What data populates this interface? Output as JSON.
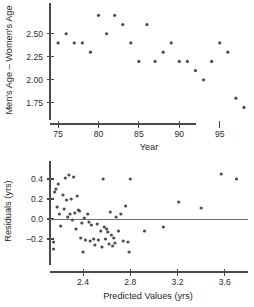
{
  "figure": {
    "background": "#ffffff",
    "point_color": "#4d4d4d",
    "axis_color": "#4a4a4a",
    "reference_line_color": "#6f6f6f"
  },
  "chart_data": [
    {
      "id": "age-difference-vs-year",
      "type": "scatter",
      "title": "",
      "xlabel": "Year",
      "ylabel": "Men's Age – Women's Age",
      "xlim": [
        74.0,
        98.5
      ],
      "ylim": [
        1.65,
        2.78
      ],
      "xticks": [
        75,
        80,
        85,
        90,
        95
      ],
      "xticklabels": [
        "75",
        "80",
        "85",
        "90",
        "95"
      ],
      "yticks": [
        1.75,
        2.0,
        2.25,
        2.5
      ],
      "yticklabels": [
        "1.75",
        "2.00",
        "2.25",
        "2.50"
      ],
      "grid": false,
      "legend": null,
      "points": [
        {
          "x": 75.0,
          "y": 2.4
        },
        {
          "x": 76.0,
          "y": 2.5
        },
        {
          "x": 77.0,
          "y": 2.4
        },
        {
          "x": 78.0,
          "y": 2.4
        },
        {
          "x": 79.0,
          "y": 2.3
        },
        {
          "x": 80.0,
          "y": 2.7
        },
        {
          "x": 81.0,
          "y": 2.5
        },
        {
          "x": 82.0,
          "y": 2.7
        },
        {
          "x": 83.0,
          "y": 2.6
        },
        {
          "x": 84.0,
          "y": 2.4
        },
        {
          "x": 85.0,
          "y": 2.2
        },
        {
          "x": 86.0,
          "y": 2.6
        },
        {
          "x": 87.0,
          "y": 2.2
        },
        {
          "x": 88.0,
          "y": 2.3
        },
        {
          "x": 89.0,
          "y": 2.4
        },
        {
          "x": 90.0,
          "y": 2.2
        },
        {
          "x": 91.0,
          "y": 2.2
        },
        {
          "x": 92.0,
          "y": 2.1
        },
        {
          "x": 93.0,
          "y": 2.0
        },
        {
          "x": 94.0,
          "y": 2.2
        },
        {
          "x": 95.0,
          "y": 2.4
        },
        {
          "x": 96.0,
          "y": 2.3
        },
        {
          "x": 97.0,
          "y": 1.8
        },
        {
          "x": 98.0,
          "y": 1.7
        }
      ]
    },
    {
      "id": "residuals-vs-predicted",
      "type": "scatter",
      "title": "",
      "xlabel": "Predicted Values (yrs)",
      "ylabel": "Residuals (yrs)",
      "xlim": [
        2.12,
        3.78
      ],
      "ylim": [
        -0.36,
        0.52
      ],
      "xticks": [
        2.4,
        2.8,
        3.2,
        3.6
      ],
      "xticklabels": [
        "2.4",
        "2.8",
        "3.2",
        "3.6"
      ],
      "yticks": [
        -0.2,
        0.0,
        0.2,
        0.4
      ],
      "yticklabels": [
        "–0.2",
        "0.0",
        "0.2",
        "0.4"
      ],
      "grid": false,
      "legend": null,
      "reference_line_y": 0.0,
      "points": [
        {
          "x": 2.15,
          "y": -0.23
        },
        {
          "x": 2.15,
          "y": -0.3
        },
        {
          "x": 2.16,
          "y": 0.27
        },
        {
          "x": 2.17,
          "y": 0.3
        },
        {
          "x": 2.18,
          "y": 0.12
        },
        {
          "x": 2.19,
          "y": 0.35
        },
        {
          "x": 2.2,
          "y": 0.05
        },
        {
          "x": 2.21,
          "y": -0.07
        },
        {
          "x": 2.23,
          "y": 0.24
        },
        {
          "x": 2.24,
          "y": 0.1
        },
        {
          "x": 2.25,
          "y": 0.41
        },
        {
          "x": 2.26,
          "y": 0.19
        },
        {
          "x": 2.27,
          "y": 0.02
        },
        {
          "x": 2.28,
          "y": 0.44
        },
        {
          "x": 2.29,
          "y": 0.05
        },
        {
          "x": 2.3,
          "y": 0.2
        },
        {
          "x": 2.31,
          "y": -0.01
        },
        {
          "x": 2.32,
          "y": 0.42
        },
        {
          "x": 2.33,
          "y": 0.06
        },
        {
          "x": 2.34,
          "y": -0.1
        },
        {
          "x": 2.35,
          "y": 0.23
        },
        {
          "x": 2.36,
          "y": 0.09
        },
        {
          "x": 2.37,
          "y": 0.08
        },
        {
          "x": 2.38,
          "y": -0.19
        },
        {
          "x": 2.39,
          "y": -0.04
        },
        {
          "x": 2.4,
          "y": -0.33
        },
        {
          "x": 2.41,
          "y": 0.01
        },
        {
          "x": 2.42,
          "y": -0.21
        },
        {
          "x": 2.44,
          "y": 0.05
        },
        {
          "x": 2.45,
          "y": -0.03
        },
        {
          "x": 2.46,
          "y": -0.22
        },
        {
          "x": 2.47,
          "y": -0.06
        },
        {
          "x": 2.49,
          "y": -0.2
        },
        {
          "x": 2.5,
          "y": -0.26
        },
        {
          "x": 2.52,
          "y": -0.05
        },
        {
          "x": 2.53,
          "y": -0.21
        },
        {
          "x": 2.55,
          "y": -0.12
        },
        {
          "x": 2.56,
          "y": -0.28
        },
        {
          "x": 2.57,
          "y": 0.4
        },
        {
          "x": 2.58,
          "y": -0.08
        },
        {
          "x": 2.59,
          "y": -0.2
        },
        {
          "x": 2.6,
          "y": -0.1
        },
        {
          "x": 2.61,
          "y": -0.13
        },
        {
          "x": 2.62,
          "y": -0.25
        },
        {
          "x": 2.63,
          "y": 0.07
        },
        {
          "x": 2.64,
          "y": -0.16
        },
        {
          "x": 2.65,
          "y": -0.27
        },
        {
          "x": 2.66,
          "y": -0.19
        },
        {
          "x": 2.67,
          "y": -0.24
        },
        {
          "x": 2.68,
          "y": 0.02
        },
        {
          "x": 2.7,
          "y": -0.12
        },
        {
          "x": 2.72,
          "y": 0.05
        },
        {
          "x": 2.74,
          "y": -0.22
        },
        {
          "x": 2.76,
          "y": 0.13
        },
        {
          "x": 2.78,
          "y": -0.23
        },
        {
          "x": 2.79,
          "y": -0.33
        },
        {
          "x": 2.8,
          "y": 0.4
        },
        {
          "x": 2.92,
          "y": -0.12
        },
        {
          "x": 3.08,
          "y": -0.08
        },
        {
          "x": 3.21,
          "y": 0.17
        },
        {
          "x": 3.4,
          "y": 0.11
        },
        {
          "x": 3.57,
          "y": 0.45
        },
        {
          "x": 3.7,
          "y": 0.4
        }
      ]
    }
  ]
}
